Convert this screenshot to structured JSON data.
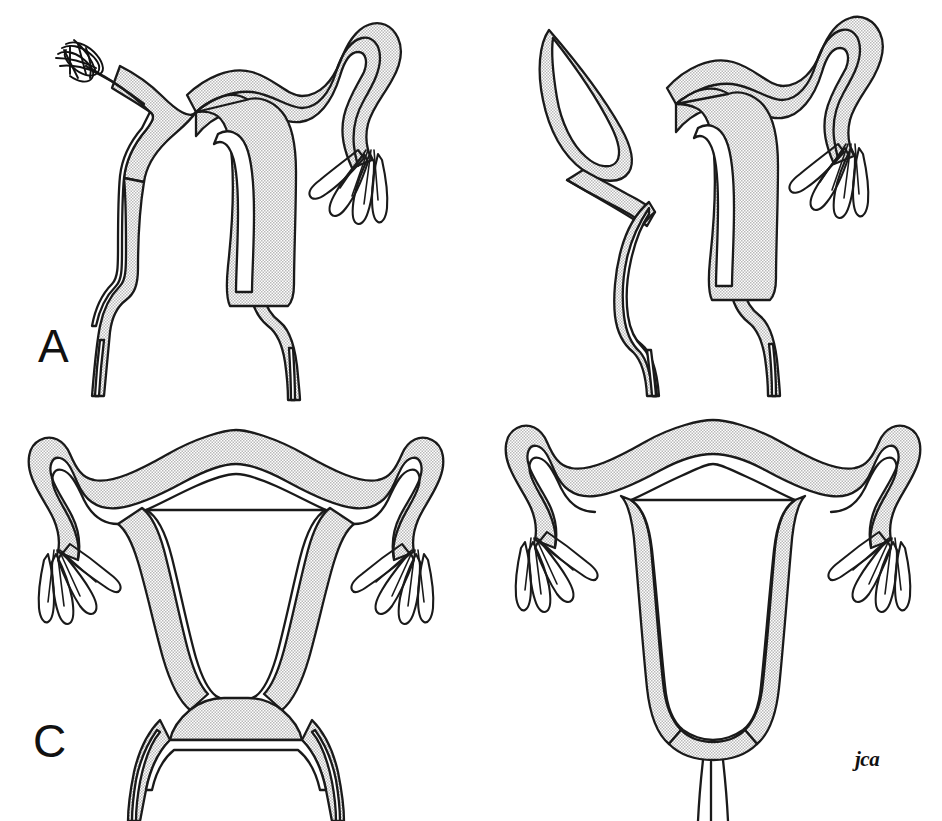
{
  "figure": {
    "width": 942,
    "height": 821,
    "background_color": "#ffffff",
    "line_color": "#1a1a1a",
    "stipple_fill_color": "#dcdcdc",
    "cavity_fill_color": "#ffffff",
    "signature": "jca",
    "style": "pen-and-ink medical line drawing with halftone stipple shading"
  },
  "panels": [
    {
      "label": "A",
      "name": "uterus-didelphys-with-damaged-left-tube",
      "description": "Didelphic uterus: two separate uterine horns and two cervices with two vaginal canals; the left fallopian tube ends in a scarred, clubbed fimbrial mass; the right tube is patent with normal fimbriae.",
      "features": [
        "two-uterine-horns",
        "two-cervices",
        "two-vaginal-canals",
        "left-tube-scarred-fimbrial-end",
        "right-tube-normal-fimbriae"
      ]
    },
    {
      "label": "B",
      "name": "uterus-didelphys-with-blind-distended-left-tube",
      "description": "Didelphic uterus with two cervices; the left fallopian tube is dilated and blind-ending (hydrosalpinx-like), tapering to a closed point; the right tube is patent with normal fimbriae.",
      "features": [
        "two-uterine-horns",
        "two-cervices",
        "two-vaginal-canals",
        "left-tube-blind-dilated",
        "right-tube-normal-fimbriae"
      ]
    },
    {
      "label": "C",
      "name": "normal-uterus-with-longitudinal-vaginal-septum",
      "description": "Single normally shaped uterus and single cervix, but the vagina is divided by a longitudinal septum into two vaginal canals; both fallopian tubes are patent with normal fimbriae.",
      "features": [
        "single-uterine-cavity",
        "single-cervix",
        "double-vagina",
        "both-tubes-normal-fimbriae"
      ]
    },
    {
      "label": "D",
      "name": "normal-uterus-single-cervix-and-vagina",
      "description": "Normal uterus with a single triangular cavity, single cervix and single vaginal canal; both fallopian tubes are patent with normal fimbriae.",
      "features": [
        "single-uterine-cavity",
        "single-cervix",
        "single-vagina",
        "both-tubes-normal-fimbriae"
      ]
    }
  ]
}
